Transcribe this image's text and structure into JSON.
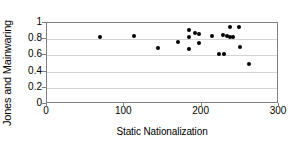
{
  "chart_data": {
    "type": "scatter",
    "title": "",
    "xlabel": "Static Nationalization",
    "ylabel": "Jones and Mainwaring",
    "xlim": [
      0,
      300
    ],
    "ylim": [
      0,
      1
    ],
    "xticks": [
      0,
      100,
      200,
      300
    ],
    "xtick_labels": [
      "0",
      "100",
      "200",
      "300"
    ],
    "yticks": [
      0,
      0.2,
      0.4,
      0.6,
      0.8,
      1
    ],
    "ytick_labels": [
      "0",
      "0.2",
      "0.4",
      "0.6",
      "0.8",
      "1"
    ],
    "grid": "horizontal",
    "legend": "none",
    "marker": "filled-diamond",
    "marker_color": "#000000",
    "series": [
      {
        "name": "observations",
        "points": [
          {
            "x": 69,
            "y": 0.825
          },
          {
            "x": 112,
            "y": 0.84
          },
          {
            "x": 143,
            "y": 0.695
          },
          {
            "x": 170,
            "y": 0.765
          },
          {
            "x": 183,
            "y": 0.915
          },
          {
            "x": 183,
            "y": 0.83
          },
          {
            "x": 184,
            "y": 0.685
          },
          {
            "x": 192,
            "y": 0.875
          },
          {
            "x": 196,
            "y": 0.865
          },
          {
            "x": 197,
            "y": 0.75
          },
          {
            "x": 213,
            "y": 0.84
          },
          {
            "x": 222,
            "y": 0.62
          },
          {
            "x": 229,
            "y": 0.62
          },
          {
            "x": 228,
            "y": 0.855
          },
          {
            "x": 233,
            "y": 0.835
          },
          {
            "x": 236,
            "y": 0.825
          },
          {
            "x": 237,
            "y": 0.945
          },
          {
            "x": 240,
            "y": 0.825
          },
          {
            "x": 248,
            "y": 0.945
          },
          {
            "x": 249,
            "y": 0.7
          },
          {
            "x": 261,
            "y": 0.5
          }
        ]
      }
    ]
  }
}
